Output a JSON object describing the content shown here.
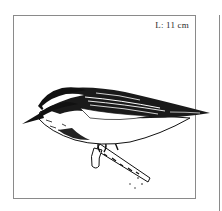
{
  "panel": {
    "length_label": "L: 11 cm",
    "subject": "nuthatch perched on branch",
    "border_color": "#8a8a8a",
    "ink_color": "#111111"
  },
  "adjacent_panel": {
    "visible": true
  }
}
